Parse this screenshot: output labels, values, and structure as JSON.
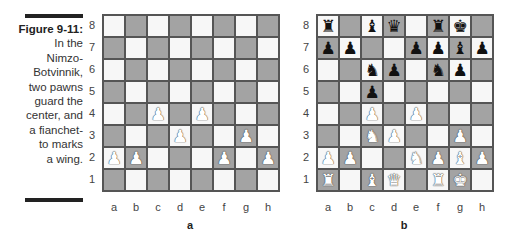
{
  "caption": {
    "title": "Figure 9-11:",
    "lines": [
      "In the",
      "Nimzo-",
      "Botvinnik,",
      "two pawns",
      "guard the",
      "center, and",
      "a fianchet-",
      "to marks",
      "a wing."
    ]
  },
  "colors": {
    "light_square": "#f7f7f7",
    "dark_square": "#a3a3a3",
    "border": "#555555"
  },
  "ranks": [
    "8",
    "7",
    "6",
    "5",
    "4",
    "3",
    "2",
    "1"
  ],
  "files": [
    "a",
    "b",
    "c",
    "d",
    "e",
    "f",
    "g",
    "h"
  ],
  "boards": [
    {
      "label": "a",
      "pieces": {
        "c4": "white-pawn",
        "e4": "white-pawn",
        "d3": "white-pawn",
        "g3": "white-pawn",
        "a2": "white-pawn",
        "b2": "white-pawn",
        "f2": "white-pawn",
        "h2": "white-pawn"
      }
    },
    {
      "label": "b",
      "pieces": {
        "a8": "black-rook",
        "c8": "black-bishop",
        "d8": "black-queen",
        "f8": "black-rook",
        "g8": "black-king",
        "a7": "black-pawn",
        "b7": "black-pawn",
        "e7": "black-pawn",
        "f7": "black-pawn",
        "g7": "black-bishop",
        "h7": "black-pawn",
        "c6": "black-knight",
        "d6": "black-pawn",
        "f6": "black-knight",
        "g6": "black-pawn",
        "c5": "black-pawn",
        "c4": "white-pawn",
        "e4": "white-pawn",
        "c3": "white-knight",
        "d3": "white-pawn",
        "g3": "white-pawn",
        "a2": "white-pawn",
        "b2": "white-pawn",
        "e2": "white-knight",
        "f2": "white-pawn",
        "g2": "white-bishop",
        "h2": "white-pawn",
        "a1": "white-rook",
        "c1": "white-bishop",
        "d1": "white-queen",
        "f1": "white-rook",
        "g1": "white-king"
      }
    }
  ],
  "glyphs": {
    "pawn": "♟",
    "knight": "♞",
    "bishop": "♝",
    "rook": "♜",
    "queen": "♛",
    "king": "♚"
  }
}
